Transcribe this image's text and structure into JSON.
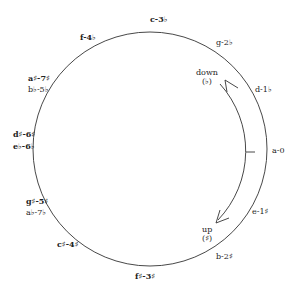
{
  "diagram": {
    "title": "",
    "type": "circle-of-fifths-minor",
    "circle": {
      "cx": 150,
      "cy": 149,
      "r": 117,
      "stroke": "#333333"
    },
    "keys": [
      {
        "id": "a",
        "label": "a-0"
      },
      {
        "id": "e",
        "label": "e-1♯"
      },
      {
        "id": "b",
        "label": "b-2♯"
      },
      {
        "id": "fsharp",
        "label": "f♯-3♯"
      },
      {
        "id": "csharp",
        "label": "c♯-4♯"
      },
      {
        "id": "gsharp",
        "label": "g♯-5♯"
      },
      {
        "id": "aflat",
        "label": "a♭-7♭"
      },
      {
        "id": "dsharp",
        "label": "d♯-6♯"
      },
      {
        "id": "eflat",
        "label": "e♭-6♭"
      },
      {
        "id": "asharp",
        "label": "a♯-7♯"
      },
      {
        "id": "bflat",
        "label": "b♭-5♭"
      },
      {
        "id": "f",
        "label": "f-4♭"
      },
      {
        "id": "c",
        "label": "c-3♭"
      },
      {
        "id": "g",
        "label": "g-2♭"
      },
      {
        "id": "d",
        "label": "d-1♭"
      }
    ],
    "arrows": {
      "down": {
        "label": "down",
        "symbol": "(♭)"
      },
      "up": {
        "label": "up",
        "symbol": "(♯)"
      }
    }
  }
}
